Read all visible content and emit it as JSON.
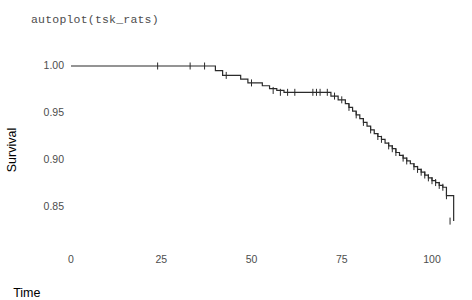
{
  "title": "autoplot(tsk_rats)",
  "axes": {
    "x": {
      "label": "Time",
      "ticks": [
        0,
        25,
        50,
        75,
        100
      ],
      "tick_labels": [
        "0",
        "25",
        "50",
        "75",
        "100"
      ],
      "range": [
        -4,
        110
      ]
    },
    "y": {
      "label": "Survival",
      "ticks": [
        1.0,
        0.95,
        0.9,
        0.85
      ],
      "tick_labels": [
        "1.00",
        "0.95",
        "0.90",
        "0.85"
      ],
      "range": [
        0.828,
        1.005
      ]
    }
  },
  "style": {
    "line_color": "#2b2b2b",
    "text_color": "#4d4d4d",
    "axis_title_color": "#000000",
    "background": "#ffffff",
    "line_width": 1.2,
    "censor_tick_height": 7,
    "grid": false,
    "axis_lines": false
  },
  "chart_data": {
    "type": "line",
    "subtype": "kaplan-meier-step",
    "title": "autoplot(tsk_rats)",
    "xlabel": "Time",
    "ylabel": "Survival",
    "xlim": [
      -4,
      110
    ],
    "ylim": [
      0.828,
      1.005
    ],
    "grid": false,
    "legend": "none",
    "series": [
      {
        "name": "Survival",
        "step": "hv",
        "x": [
          0,
          37,
          40,
          42,
          45,
          47,
          49,
          51,
          53,
          55,
          57,
          59,
          61,
          63,
          66,
          70,
          72,
          74,
          76,
          77,
          78,
          79,
          80,
          81,
          82,
          83,
          84,
          85,
          86,
          87,
          88,
          89,
          90,
          91,
          92,
          93,
          94,
          95,
          96,
          97,
          98,
          99,
          100,
          101,
          102,
          103,
          104,
          106
        ],
        "y": [
          1.0,
          1.0,
          0.995,
          0.99,
          0.99,
          0.986,
          0.982,
          0.982,
          0.979,
          0.976,
          0.974,
          0.972,
          0.972,
          0.972,
          0.972,
          0.972,
          0.968,
          0.964,
          0.96,
          0.956,
          0.952,
          0.948,
          0.944,
          0.94,
          0.936,
          0.932,
          0.928,
          0.925,
          0.922,
          0.918,
          0.915,
          0.912,
          0.908,
          0.905,
          0.902,
          0.899,
          0.896,
          0.893,
          0.89,
          0.887,
          0.884,
          0.881,
          0.878,
          0.876,
          0.873,
          0.871,
          0.862,
          0.835
        ]
      }
    ],
    "censored_marks": {
      "description": "censoring tick marks on the step curve",
      "points": [
        {
          "x": 24,
          "y": 1.0
        },
        {
          "x": 33,
          "y": 1.0
        },
        {
          "x": 37,
          "y": 1.0
        },
        {
          "x": 43,
          "y": 0.99
        },
        {
          "x": 50,
          "y": 0.982
        },
        {
          "x": 56,
          "y": 0.974
        },
        {
          "x": 58,
          "y": 0.972
        },
        {
          "x": 60,
          "y": 0.972
        },
        {
          "x": 62,
          "y": 0.972
        },
        {
          "x": 67,
          "y": 0.972
        },
        {
          "x": 68,
          "y": 0.972
        },
        {
          "x": 69,
          "y": 0.972
        },
        {
          "x": 71,
          "y": 0.972
        },
        {
          "x": 73,
          "y": 0.968
        },
        {
          "x": 75,
          "y": 0.964
        },
        {
          "x": 77,
          "y": 0.956
        },
        {
          "x": 79,
          "y": 0.948
        },
        {
          "x": 81,
          "y": 0.94
        },
        {
          "x": 83,
          "y": 0.932
        },
        {
          "x": 85,
          "y": 0.925
        },
        {
          "x": 86,
          "y": 0.922
        },
        {
          "x": 88,
          "y": 0.915
        },
        {
          "x": 89,
          "y": 0.912
        },
        {
          "x": 90,
          "y": 0.908
        },
        {
          "x": 92,
          "y": 0.902
        },
        {
          "x": 93,
          "y": 0.899
        },
        {
          "x": 95,
          "y": 0.893
        },
        {
          "x": 96,
          "y": 0.89
        },
        {
          "x": 97,
          "y": 0.887
        },
        {
          "x": 98,
          "y": 0.884
        },
        {
          "x": 99,
          "y": 0.881
        },
        {
          "x": 100,
          "y": 0.878
        },
        {
          "x": 101,
          "y": 0.876
        },
        {
          "x": 102,
          "y": 0.873
        },
        {
          "x": 103,
          "y": 0.871
        },
        {
          "x": 104,
          "y": 0.862
        },
        {
          "x": 105,
          "y": 0.835
        }
      ]
    }
  }
}
